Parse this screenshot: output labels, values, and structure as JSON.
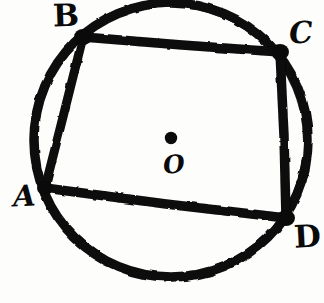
{
  "figure": {
    "style": "hand-drawn ink sketch",
    "background_color": "#fdfdfc",
    "ink_color": "#0a0a0a"
  },
  "labels": {
    "A": "A",
    "B": "B",
    "C": "C",
    "D": "D",
    "O": "O"
  },
  "geometry": {
    "circle": {
      "center_x": 171,
      "center_y": 140,
      "radius": 137,
      "stroke_width": 9
    },
    "center_dot": {
      "cx": 171,
      "cy": 138,
      "r": 6
    },
    "vertices": {
      "A": {
        "x": 45,
        "y": 188
      },
      "B": {
        "x": 83,
        "y": 37
      },
      "C": {
        "x": 280,
        "y": 52
      },
      "D": {
        "x": 286,
        "y": 218
      }
    },
    "edges": [
      {
        "name": "AB",
        "from": "A",
        "to": "B"
      },
      {
        "name": "BC",
        "from": "B",
        "to": "C"
      },
      {
        "name": "CD",
        "from": "C",
        "to": "D"
      },
      {
        "name": "DA",
        "from": "D",
        "to": "A"
      }
    ]
  }
}
